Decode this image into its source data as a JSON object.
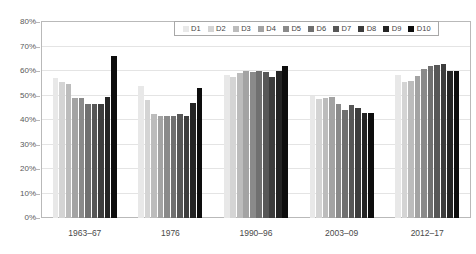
{
  "chart_data": {
    "type": "bar",
    "title": "",
    "xlabel": "",
    "ylabel": "",
    "ylim": [
      0,
      80
    ],
    "ytick_labels": [
      "0%",
      "10%",
      "20%",
      "30%",
      "40%",
      "50%",
      "60%",
      "70%",
      "80%"
    ],
    "ytick_values": [
      0,
      10,
      20,
      30,
      40,
      50,
      60,
      70,
      80
    ],
    "grid": true,
    "legend_position": "top-right",
    "categories": [
      "1963–67",
      "1976",
      "1990–96",
      "2003–09",
      "2012–17"
    ],
    "series": [
      {
        "name": "D1",
        "color": "#e8e8e8",
        "values": [
          57.0,
          54.0,
          58.5,
          50.0,
          58.5
        ]
      },
      {
        "name": "D2",
        "color": "#d4d4d4",
        "values": [
          55.5,
          48.0,
          57.5,
          48.5,
          55.5
        ]
      },
      {
        "name": "D3",
        "color": "#bcbcbc",
        "values": [
          54.5,
          42.5,
          59.0,
          49.0,
          56.0
        ]
      },
      {
        "name": "D4",
        "color": "#a3a3a3",
        "values": [
          49.0,
          41.5,
          60.0,
          49.5,
          58.0
        ]
      },
      {
        "name": "D5",
        "color": "#8a8a8a",
        "values": [
          49.0,
          41.5,
          59.5,
          46.5,
          61.0
        ]
      },
      {
        "name": "D6",
        "color": "#707070",
        "values": [
          46.5,
          41.5,
          60.0,
          44.0,
          62.0
        ]
      },
      {
        "name": "D7",
        "color": "#575757",
        "values": [
          46.5,
          42.5,
          59.5,
          46.0,
          62.5
        ]
      },
      {
        "name": "D8",
        "color": "#3d3d3d",
        "values": [
          46.5,
          41.5,
          57.5,
          45.0,
          63.0
        ]
      },
      {
        "name": "D9",
        "color": "#242424",
        "values": [
          49.5,
          47.0,
          60.0,
          43.0,
          60.0
        ]
      },
      {
        "name": "D10",
        "color": "#0d0d0d",
        "values": [
          66.0,
          53.0,
          62.0,
          43.0,
          60.0
        ]
      }
    ]
  },
  "legend": {
    "items": [
      {
        "label": "D1"
      },
      {
        "label": "D2"
      },
      {
        "label": "D3"
      },
      {
        "label": "D4"
      },
      {
        "label": "D5"
      },
      {
        "label": "D6"
      },
      {
        "label": "D7"
      },
      {
        "label": "D8"
      },
      {
        "label": "D9"
      },
      {
        "label": "D10"
      }
    ]
  }
}
